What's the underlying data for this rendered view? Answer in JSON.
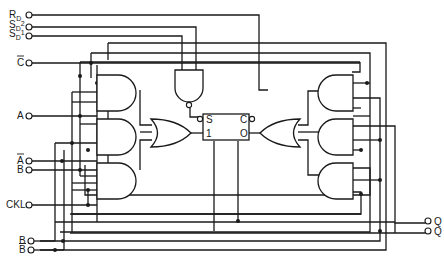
{
  "diagram": {
    "type": "logic-schematic",
    "inputs_left": [
      {
        "id": "rd",
        "label": "R",
        "sub": "D",
        "y": 15
      },
      {
        "id": "sd2",
        "label": "S",
        "sub": "D",
        "sup": "2",
        "y": 27
      },
      {
        "id": "sd1",
        "label": "S",
        "sub": "D",
        "sup": "1",
        "y": 36
      },
      {
        "id": "cbar",
        "label": "C",
        "overbar": true,
        "y": 63
      },
      {
        "id": "a",
        "label": "A",
        "y": 116
      },
      {
        "id": "abar",
        "label": "A",
        "overbar": true,
        "y": 161
      },
      {
        "id": "b",
        "label": "B",
        "y": 170
      },
      {
        "id": "ckl",
        "label": "CKL",
        "y": 205
      },
      {
        "id": "b2",
        "label": "B",
        "y": 241
      },
      {
        "id": "bbar",
        "label": "B",
        "overbar": true,
        "y": 250
      }
    ],
    "outputs_right": [
      {
        "id": "q",
        "label": "Q",
        "y": 221
      },
      {
        "id": "qbar",
        "label": "Q",
        "y": 231
      }
    ],
    "flipflop": {
      "pins": {
        "top_left": "S",
        "bottom_left": "1",
        "top_right": "C",
        "bottom_right": "O"
      }
    },
    "gates": {
      "left_and_count": 3,
      "right_and_count": 3,
      "or_count": 2,
      "nand_count": 1
    },
    "colors": {
      "line": "#1a1a1a",
      "background": "#ffffff"
    }
  }
}
